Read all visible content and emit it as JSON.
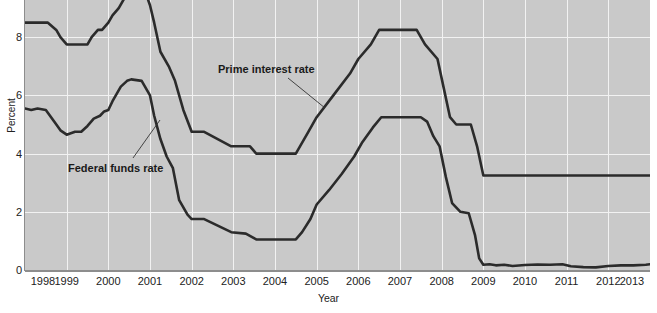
{
  "chart_data": {
    "type": "line",
    "title": "",
    "xlabel": "Year",
    "ylabel": "Percent",
    "xlim": [
      1998,
      2013
    ],
    "ylim": [
      0,
      9.3
    ],
    "grid": true,
    "legend_position": "inline-annotations",
    "y_ticks": [
      0,
      2,
      4,
      6,
      8
    ],
    "x_ticks": [
      1998,
      1999,
      2000,
      2001,
      2002,
      2003,
      2004,
      2005,
      2006,
      2007,
      2008,
      2009,
      2010,
      2011,
      2012,
      2013
    ],
    "annotations": [
      {
        "text": "Prime interest rate",
        "series": "Prime interest rate"
      },
      {
        "text": "Federal funds rate",
        "series": "Federal funds rate"
      }
    ],
    "series": [
      {
        "name": "Prime interest rate",
        "color": "#2b2b2b",
        "points": [
          [
            1998.0,
            8.5
          ],
          [
            1998.55,
            8.5
          ],
          [
            1998.75,
            8.25
          ],
          [
            1998.85,
            8.0
          ],
          [
            1999.0,
            7.75
          ],
          [
            1999.5,
            7.75
          ],
          [
            1999.6,
            8.0
          ],
          [
            1999.75,
            8.25
          ],
          [
            1999.85,
            8.25
          ],
          [
            2000.0,
            8.5
          ],
          [
            2000.1,
            8.75
          ],
          [
            2000.25,
            9.0
          ],
          [
            2000.45,
            9.5
          ],
          [
            2000.9,
            9.5
          ],
          [
            2001.0,
            9.1
          ],
          [
            2001.1,
            8.5
          ],
          [
            2001.25,
            7.5
          ],
          [
            2001.45,
            7.0
          ],
          [
            2001.6,
            6.5
          ],
          [
            2001.8,
            5.5
          ],
          [
            2002.0,
            4.75
          ],
          [
            2002.3,
            4.75
          ],
          [
            2002.95,
            4.25
          ],
          [
            2003.4,
            4.25
          ],
          [
            2003.55,
            4.0
          ],
          [
            2004.5,
            4.0
          ],
          [
            2004.6,
            4.25
          ],
          [
            2004.8,
            4.75
          ],
          [
            2005.0,
            5.25
          ],
          [
            2005.4,
            6.0
          ],
          [
            2005.8,
            6.75
          ],
          [
            2006.0,
            7.25
          ],
          [
            2006.3,
            7.75
          ],
          [
            2006.5,
            8.25
          ],
          [
            2007.4,
            8.25
          ],
          [
            2007.6,
            7.75
          ],
          [
            2007.9,
            7.25
          ],
          [
            2008.05,
            6.25
          ],
          [
            2008.2,
            5.25
          ],
          [
            2008.35,
            5.0
          ],
          [
            2008.7,
            5.0
          ],
          [
            2008.85,
            4.25
          ],
          [
            2009.0,
            3.25
          ],
          [
            2013.0,
            3.25
          ]
        ]
      },
      {
        "name": "Federal funds rate",
        "color": "#2b2b2b",
        "points": [
          [
            1998.0,
            5.55
          ],
          [
            1998.15,
            5.5
          ],
          [
            1998.3,
            5.55
          ],
          [
            1998.5,
            5.5
          ],
          [
            1998.7,
            5.1
          ],
          [
            1998.85,
            4.8
          ],
          [
            1999.0,
            4.65
          ],
          [
            1999.2,
            4.75
          ],
          [
            1999.35,
            4.75
          ],
          [
            1999.5,
            4.95
          ],
          [
            1999.65,
            5.2
          ],
          [
            1999.8,
            5.3
          ],
          [
            1999.9,
            5.45
          ],
          [
            2000.0,
            5.5
          ],
          [
            2000.1,
            5.8
          ],
          [
            2000.2,
            6.05
          ],
          [
            2000.3,
            6.3
          ],
          [
            2000.45,
            6.5
          ],
          [
            2000.55,
            6.55
          ],
          [
            2000.8,
            6.5
          ],
          [
            2001.0,
            6.0
          ],
          [
            2001.1,
            5.3
          ],
          [
            2001.25,
            4.5
          ],
          [
            2001.4,
            3.9
          ],
          [
            2001.55,
            3.5
          ],
          [
            2001.7,
            2.4
          ],
          [
            2001.9,
            1.9
          ],
          [
            2002.0,
            1.75
          ],
          [
            2002.3,
            1.75
          ],
          [
            2002.95,
            1.3
          ],
          [
            2003.3,
            1.25
          ],
          [
            2003.55,
            1.05
          ],
          [
            2004.5,
            1.05
          ],
          [
            2004.65,
            1.3
          ],
          [
            2004.85,
            1.75
          ],
          [
            2005.0,
            2.25
          ],
          [
            2005.3,
            2.75
          ],
          [
            2005.6,
            3.3
          ],
          [
            2005.9,
            3.9
          ],
          [
            2006.1,
            4.4
          ],
          [
            2006.35,
            4.9
          ],
          [
            2006.55,
            5.25
          ],
          [
            2007.5,
            5.25
          ],
          [
            2007.65,
            5.1
          ],
          [
            2007.8,
            4.6
          ],
          [
            2007.95,
            4.25
          ],
          [
            2008.1,
            3.2
          ],
          [
            2008.25,
            2.3
          ],
          [
            2008.45,
            2.0
          ],
          [
            2008.65,
            1.95
          ],
          [
            2008.8,
            1.2
          ],
          [
            2008.9,
            0.4
          ],
          [
            2009.0,
            0.18
          ],
          [
            2009.15,
            0.2
          ],
          [
            2009.3,
            0.16
          ],
          [
            2009.5,
            0.18
          ],
          [
            2009.7,
            0.14
          ],
          [
            2010.0,
            0.17
          ],
          [
            2010.3,
            0.19
          ],
          [
            2010.6,
            0.18
          ],
          [
            2010.9,
            0.2
          ],
          [
            2011.1,
            0.13
          ],
          [
            2011.4,
            0.1
          ],
          [
            2011.7,
            0.09
          ],
          [
            2012.0,
            0.14
          ],
          [
            2012.3,
            0.16
          ],
          [
            2012.6,
            0.16
          ],
          [
            2012.9,
            0.18
          ],
          [
            2013.0,
            0.2
          ]
        ]
      }
    ]
  }
}
